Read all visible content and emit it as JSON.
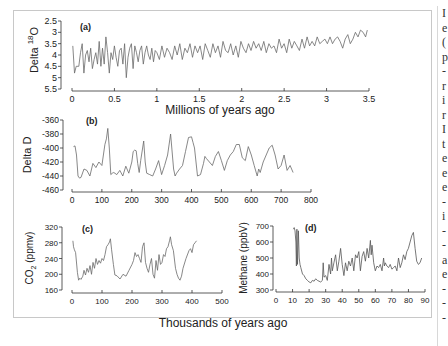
{
  "figure": {
    "shared_xlabel_top": "Millions of years ago",
    "shared_xlabel_bottom": "Thousands of years ago"
  },
  "side_text_fragments": [
    "I",
    "e",
    "(",
    "p",
    "-",
    "r",
    "i",
    "r",
    "I",
    "t",
    "e",
    "e",
    "e",
    "-",
    "i",
    "-",
    "-",
    "a",
    "e",
    "-",
    "-",
    "-"
  ],
  "colors": {
    "line": "#6a6a6a",
    "axis": "#333333",
    "frame": "#c8c8c8",
    "text": "#222222"
  },
  "chart_data": [
    {
      "id": "a",
      "type": "line",
      "panel_label": "(a)",
      "title": "",
      "xlabel": "Millions of years ago",
      "ylabel": "Delta 18O",
      "ylabel_parts": {
        "pre": "Delta ",
        "sup": "18",
        "post": "O"
      },
      "xlim": [
        0,
        3.5
      ],
      "ylim": [
        2.5,
        5.5
      ],
      "y_inverted": true,
      "xticks": [
        0,
        0.5,
        1,
        1.5,
        2,
        2.5,
        3,
        3.5
      ],
      "xtick_labels": [
        "0",
        "0.5",
        "1",
        "1.5",
        "2",
        "2.5",
        "3",
        "3.5"
      ],
      "yticks": [
        2.5,
        3,
        3.5,
        4,
        4.5,
        5,
        5.5
      ],
      "ytick_labels": [
        "2.5",
        "3",
        "3.5",
        "4",
        "4.5",
        "5",
        "5.5"
      ],
      "grid": false,
      "x": [
        0.01,
        0.03,
        0.05,
        0.08,
        0.1,
        0.12,
        0.14,
        0.16,
        0.18,
        0.2,
        0.22,
        0.24,
        0.26,
        0.28,
        0.3,
        0.32,
        0.34,
        0.36,
        0.38,
        0.4,
        0.42,
        0.44,
        0.46,
        0.48,
        0.5,
        0.52,
        0.54,
        0.56,
        0.58,
        0.6,
        0.62,
        0.64,
        0.66,
        0.68,
        0.7,
        0.72,
        0.74,
        0.76,
        0.78,
        0.8,
        0.82,
        0.84,
        0.86,
        0.88,
        0.9,
        0.92,
        0.94,
        0.96,
        0.98,
        1.0,
        1.03,
        1.06,
        1.09,
        1.12,
        1.15,
        1.18,
        1.21,
        1.24,
        1.27,
        1.3,
        1.33,
        1.36,
        1.39,
        1.42,
        1.45,
        1.48,
        1.51,
        1.54,
        1.57,
        1.6,
        1.63,
        1.66,
        1.69,
        1.72,
        1.75,
        1.78,
        1.81,
        1.84,
        1.87,
        1.9,
        1.93,
        1.96,
        1.99,
        2.02,
        2.05,
        2.08,
        2.11,
        2.14,
        2.17,
        2.2,
        2.23,
        2.26,
        2.29,
        2.32,
        2.35,
        2.38,
        2.41,
        2.44,
        2.47,
        2.5,
        2.53,
        2.56,
        2.59,
        2.62,
        2.65,
        2.68,
        2.71,
        2.74,
        2.77,
        2.8,
        2.83,
        2.86,
        2.89,
        2.92,
        2.95,
        2.98,
        3.01,
        3.04,
        3.07,
        3.1,
        3.13,
        3.16,
        3.19,
        3.22,
        3.25,
        3.28,
        3.31,
        3.34,
        3.37,
        3.4,
        3.43,
        3.46,
        3.48
      ],
      "values": [
        3.6,
        4.8,
        4.5,
        4.5,
        3.9,
        3.5,
        4.8,
        4.0,
        3.8,
        4.3,
        3.7,
        4.6,
        4.2,
        3.9,
        4.4,
        3.4,
        4.5,
        3.7,
        4.4,
        3.2,
        3.9,
        4.8,
        3.9,
        4.2,
        3.6,
        4.1,
        4.5,
        3.8,
        3.7,
        4.4,
        3.5,
        5.0,
        4.1,
        3.7,
        3.5,
        4.6,
        3.6,
        3.9,
        4.3,
        3.8,
        3.6,
        4.4,
        3.9,
        3.6,
        4.0,
        4.2,
        3.7,
        4.3,
        3.8,
        3.9,
        4.2,
        3.6,
        4.1,
        3.7,
        3.9,
        4.2,
        3.6,
        4.0,
        3.5,
        4.2,
        3.7,
        3.9,
        3.5,
        4.1,
        3.6,
        3.9,
        3.6,
        4.2,
        3.5,
        3.8,
        4.1,
        3.5,
        3.9,
        3.6,
        4.1,
        3.4,
        3.8,
        3.9,
        3.5,
        4.0,
        3.6,
        4.1,
        3.4,
        3.7,
        3.9,
        3.5,
        3.8,
        3.4,
        3.7,
        3.5,
        3.8,
        3.4,
        3.9,
        3.5,
        3.7,
        3.6,
        3.9,
        3.3,
        3.7,
        3.5,
        3.9,
        3.3,
        3.7,
        3.4,
        3.6,
        3.8,
        3.3,
        3.7,
        3.2,
        3.6,
        3.4,
        3.6,
        3.2,
        3.5,
        3.4,
        3.3,
        3.5,
        3.2,
        3.5,
        3.3,
        3.2,
        3.4,
        3.7,
        3.3,
        3.1,
        3.5,
        3.3,
        3.0,
        3.2,
        2.9,
        3.0,
        3.2,
        2.9
      ]
    },
    {
      "id": "b",
      "type": "line",
      "panel_label": "(b)",
      "title": "",
      "xlabel": "",
      "ylabel": "Delta D",
      "xlim": [
        0,
        800
      ],
      "ylim": [
        -460,
        -360
      ],
      "xticks": [
        0,
        100,
        200,
        300,
        400,
        500,
        600,
        700,
        800
      ],
      "xtick_labels": [
        "0",
        "100",
        "200",
        "300",
        "400",
        "500",
        "600",
        "700",
        "800"
      ],
      "yticks": [
        -360,
        -380,
        -400,
        -420,
        -440,
        -460
      ],
      "ytick_labels": [
        "-360",
        "-380",
        "-400",
        "-420",
        "-440",
        "-460"
      ],
      "grid": false,
      "x": [
        5,
        10,
        15,
        20,
        25,
        30,
        40,
        50,
        60,
        70,
        80,
        90,
        100,
        105,
        110,
        115,
        120,
        125,
        130,
        135,
        140,
        150,
        160,
        170,
        180,
        190,
        200,
        205,
        210,
        215,
        220,
        225,
        230,
        240,
        245,
        250,
        260,
        270,
        280,
        290,
        300,
        310,
        320,
        330,
        340,
        345,
        350,
        360,
        370,
        380,
        390,
        400,
        405,
        410,
        420,
        430,
        440,
        445,
        450,
        460,
        470,
        480,
        490,
        500,
        510,
        520,
        530,
        540,
        550,
        560,
        570,
        580,
        590,
        600,
        610,
        620,
        625,
        630,
        640,
        650,
        660,
        670,
        680,
        690,
        700,
        710,
        720,
        730,
        740
      ],
      "values": [
        -398,
        -397,
        -410,
        -440,
        -443,
        -442,
        -430,
        -432,
        -440,
        -422,
        -428,
        -420,
        -425,
        -410,
        -395,
        -387,
        -372,
        -400,
        -438,
        -436,
        -435,
        -438,
        -432,
        -440,
        -426,
        -436,
        -420,
        -405,
        -403,
        -404,
        -422,
        -435,
        -418,
        -390,
        -420,
        -436,
        -438,
        -440,
        -430,
        -418,
        -438,
        -425,
        -410,
        -380,
        -430,
        -440,
        -436,
        -430,
        -425,
        -405,
        -385,
        -384,
        -392,
        -400,
        -440,
        -438,
        -422,
        -412,
        -415,
        -420,
        -425,
        -412,
        -405,
        -418,
        -432,
        -418,
        -410,
        -405,
        -395,
        -395,
        -414,
        -418,
        -398,
        -410,
        -425,
        -440,
        -430,
        -435,
        -420,
        -410,
        -400,
        -396,
        -410,
        -430,
        -425,
        -410,
        -432,
        -425,
        -435
      ]
    },
    {
      "id": "c",
      "type": "line",
      "panel_label": "(c)",
      "title": "",
      "xlabel": "Thousands of years ago",
      "ylabel": "CO2 (ppmv)",
      "ylabel_parts": {
        "pre": "CO",
        "sub": "2",
        "post": " (ppmv)"
      },
      "xlim": [
        0,
        500
      ],
      "ylim": [
        160,
        320
      ],
      "xticks": [
        0,
        100,
        200,
        300,
        400,
        500
      ],
      "xtick_labels": [
        "0",
        "100",
        "200",
        "300",
        "400",
        "500"
      ],
      "yticks": [
        160,
        200,
        240,
        280,
        320
      ],
      "ytick_labels": [
        "160",
        "200",
        "240",
        "280",
        "320"
      ],
      "grid": false,
      "x": [
        3,
        5,
        8,
        12,
        18,
        22,
        26,
        30,
        36,
        40,
        45,
        50,
        55,
        60,
        65,
        70,
        75,
        80,
        85,
        90,
        95,
        100,
        105,
        110,
        115,
        120,
        125,
        128,
        132,
        138,
        143,
        150,
        160,
        170,
        180,
        190,
        200,
        205,
        210,
        215,
        220,
        225,
        230,
        235,
        240,
        245,
        250,
        255,
        260,
        265,
        270,
        275,
        280,
        285,
        290,
        295,
        300,
        305,
        310,
        315,
        320,
        325,
        328,
        332,
        338,
        345,
        350,
        355,
        360,
        365,
        370,
        380,
        390,
        395,
        400,
        405,
        410,
        415
      ],
      "values": [
        285,
        270,
        262,
        255,
        205,
        185,
        190,
        187,
        195,
        210,
        198,
        215,
        205,
        222,
        200,
        230,
        215,
        240,
        225,
        235,
        228,
        240,
        235,
        250,
        270,
        275,
        282,
        290,
        262,
        225,
        198,
        196,
        188,
        200,
        195,
        210,
        225,
        235,
        255,
        245,
        250,
        240,
        230,
        270,
        280,
        230,
        215,
        205,
        225,
        240,
        200,
        190,
        235,
        210,
        250,
        225,
        230,
        250,
        245,
        265,
        270,
        285,
        295,
        275,
        260,
        215,
        200,
        190,
        185,
        195,
        215,
        240,
        260,
        265,
        255,
        275,
        280,
        285
      ]
    },
    {
      "id": "d",
      "type": "line",
      "panel_label": "(d)",
      "title": "",
      "xlabel": "Thousands of years ago",
      "ylabel": "Methane (ppbV)",
      "xlim": [
        0,
        90
      ],
      "ylim": [
        300,
        700
      ],
      "xticks": [
        0,
        10,
        20,
        30,
        40,
        50,
        60,
        70,
        80,
        90
      ],
      "xtick_labels": [
        "0",
        "10",
        "20",
        "30",
        "40",
        "50",
        "60",
        "70",
        "80",
        "90"
      ],
      "yticks": [
        300,
        400,
        500,
        600,
        700
      ],
      "ytick_labels": [
        "300",
        "400",
        "500",
        "600",
        "700"
      ],
      "grid": false,
      "x": [
        10.5,
        11,
        11.5,
        12,
        12.3,
        12.6,
        13,
        13.5,
        14,
        14.5,
        15,
        16,
        17,
        18,
        19,
        20,
        21,
        22,
        23,
        24,
        25,
        26,
        27,
        28,
        28.5,
        29,
        30,
        31,
        32,
        33,
        33.5,
        34,
        35,
        36,
        37,
        38,
        39,
        40,
        41,
        42,
        43,
        44,
        45,
        46,
        47,
        48,
        49,
        50,
        51,
        52,
        53,
        54,
        55,
        56,
        57,
        57.5,
        58,
        59,
        60,
        61,
        62,
        63,
        64,
        65,
        65.5,
        66,
        67,
        68,
        69,
        70,
        71,
        72,
        73,
        74,
        75,
        76,
        77,
        78,
        79,
        80,
        81,
        82,
        83,
        84,
        85,
        86,
        87,
        88
      ],
      "values": [
        680,
        690,
        670,
        600,
        450,
        680,
        460,
        670,
        500,
        460,
        440,
        400,
        390,
        370,
        360,
        350,
        345,
        360,
        355,
        370,
        360,
        355,
        350,
        360,
        470,
        380,
        390,
        360,
        460,
        400,
        500,
        420,
        470,
        520,
        420,
        480,
        560,
        460,
        390,
        470,
        420,
        480,
        450,
        500,
        420,
        520,
        500,
        540,
        420,
        510,
        540,
        480,
        560,
        500,
        610,
        520,
        580,
        470,
        420,
        450,
        440,
        460,
        420,
        500,
        450,
        470,
        450,
        440,
        460,
        430,
        440,
        450,
        420,
        500,
        440,
        470,
        520,
        490,
        540,
        560,
        600,
        640,
        660,
        560,
        480,
        460,
        470,
        500
      ]
    }
  ]
}
